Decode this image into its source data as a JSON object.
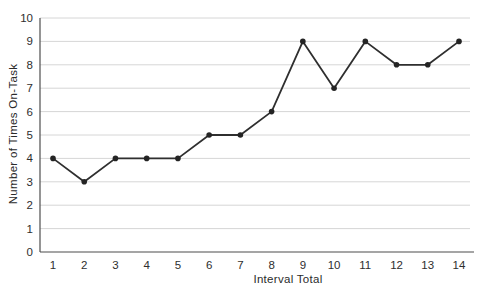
{
  "chart_data": {
    "type": "line",
    "title": "",
    "xlabel": "Interval Total",
    "ylabel": "Number of Times On-Task",
    "x": [
      1,
      2,
      3,
      4,
      5,
      6,
      7,
      8,
      9,
      10,
      11,
      12,
      13,
      14
    ],
    "values": [
      4,
      3,
      4,
      4,
      4,
      5,
      5,
      6,
      9,
      7,
      9,
      8,
      8,
      9
    ],
    "series_name": "Number of Times On-Task",
    "ylim": [
      0,
      10
    ],
    "yticks": [
      0,
      1,
      2,
      3,
      4,
      5,
      6,
      7,
      8,
      9,
      10
    ],
    "grid": true,
    "legend_position": "none",
    "marker": "circle",
    "line_color": "#2f2f2f",
    "marker_color": "#242424",
    "grid_color": "#d6d6d6",
    "axis_color": "#4d4d4d",
    "text_color": "#2e2e2e",
    "background": "#ffffff"
  }
}
